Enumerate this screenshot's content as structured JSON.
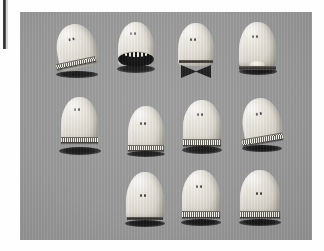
{
  "page": {
    "background_color": "#fefefe",
    "gutter_bar_color": "#2b2b2b"
  },
  "photo": {
    "background_color": "#9a9a9a",
    "body_color": "#e9e6de",
    "shadow_color": "#141414",
    "accent_dark": "#2d2b27",
    "x": 20,
    "y": 12,
    "width": 292,
    "height": 228,
    "subject_count": 11,
    "grid_rows": 3,
    "row_counts": [
      4,
      4,
      3
    ],
    "description": "Eleven rounded capsule-shaped figures with two dot eyes arranged on a gray surface"
  },
  "figures": [
    {
      "id": "figure-1",
      "row": 1,
      "column": 1,
      "pose": "tilted-left",
      "mouth": "toothed-band",
      "x": 54,
      "y": 24,
      "w": 44,
      "h": 54,
      "body": {
        "x": 2,
        "y": 0,
        "w": 40,
        "h": 44,
        "rotate": -12
      },
      "eyes": {
        "x": 16,
        "y": 13
      },
      "band": {
        "x": 2,
        "y": 36,
        "w": 40,
        "h": 4,
        "rotate": -12
      },
      "shadow": {
        "x": 2,
        "y": 47,
        "w": 42,
        "h": 7
      }
    },
    {
      "id": "figure-2",
      "row": 1,
      "column": 2,
      "pose": "upright",
      "mouth": "wide-open-dark",
      "x": 116,
      "y": 22,
      "w": 40,
      "h": 56,
      "body": {
        "x": 2,
        "y": 0,
        "w": 36,
        "h": 44,
        "rotate": 0
      },
      "eyes": {
        "x": 14,
        "y": 10
      },
      "mouth_open": {
        "x": 2,
        "y": 29,
        "w": 36,
        "h": 15
      },
      "shadow": {
        "x": 1,
        "y": 43,
        "w": 38,
        "h": 8
      }
    },
    {
      "id": "figure-3",
      "row": 1,
      "column": 3,
      "pose": "upright",
      "mouth": "closed-rim",
      "x": 176,
      "y": 23,
      "w": 40,
      "h": 58,
      "body": {
        "x": 2,
        "y": 0,
        "w": 36,
        "h": 43,
        "rotate": 0
      },
      "eyes": {
        "x": 14,
        "y": 15
      },
      "rim": {
        "x": 3,
        "y": 37,
        "w": 34,
        "h": 3
      },
      "bowtie": {
        "x": 5,
        "y": 42,
        "w": 30,
        "h": 13
      }
    },
    {
      "id": "figure-4",
      "row": 1,
      "column": 4,
      "pose": "upright",
      "mouth": "rim-with-blob",
      "x": 237,
      "y": 22,
      "w": 42,
      "h": 56,
      "body": {
        "x": 2,
        "y": 0,
        "w": 37,
        "h": 45,
        "rotate": 0
      },
      "eyes": {
        "x": 15,
        "y": 13
      },
      "blob": {
        "x": 12,
        "y": 39,
        "w": 16,
        "h": 7
      },
      "rim": {
        "x": 2,
        "y": 44,
        "w": 37,
        "h": 4
      },
      "shadow": {
        "x": 2,
        "y": 46,
        "w": 38,
        "h": 7
      }
    },
    {
      "id": "figure-5",
      "row": 2,
      "column": 1,
      "pose": "upright",
      "mouth": "toothed-band",
      "x": 59,
      "y": 97,
      "w": 42,
      "h": 60,
      "body": {
        "x": 2,
        "y": 0,
        "w": 37,
        "h": 45,
        "rotate": 0
      },
      "eyes": {
        "x": 15,
        "y": 11
      },
      "band": {
        "x": 2,
        "y": 40,
        "w": 37,
        "h": 4,
        "rotate": 0
      },
      "shadow": {
        "x": 0,
        "y": 50,
        "w": 42,
        "h": 8
      }
    },
    {
      "id": "figure-6",
      "row": 2,
      "column": 2,
      "pose": "upright",
      "mouth": "toothed-band",
      "x": 126,
      "y": 106,
      "w": 40,
      "h": 54,
      "body": {
        "x": 2,
        "y": 0,
        "w": 36,
        "h": 44,
        "rotate": 0
      },
      "eyes": {
        "x": 14,
        "y": 16
      },
      "band": {
        "x": 2,
        "y": 39,
        "w": 36,
        "h": 4,
        "rotate": 0
      },
      "shadow": {
        "x": 1,
        "y": 45,
        "w": 38,
        "h": 6
      }
    },
    {
      "id": "figure-7",
      "row": 2,
      "column": 3,
      "pose": "upright",
      "mouth": "toothed-band",
      "x": 181,
      "y": 100,
      "w": 42,
      "h": 58,
      "body": {
        "x": 2,
        "y": 0,
        "w": 38,
        "h": 44,
        "rotate": 0
      },
      "eyes": {
        "x": 16,
        "y": 13
      },
      "band": {
        "x": 2,
        "y": 39,
        "w": 38,
        "h": 5,
        "rotate": 0
      },
      "shadow": {
        "x": 1,
        "y": 46,
        "w": 40,
        "h": 8
      }
    },
    {
      "id": "figure-8",
      "row": 2,
      "column": 4,
      "pose": "tilted-left",
      "mouth": "toothed-band",
      "x": 240,
      "y": 98,
      "w": 46,
      "h": 58,
      "body": {
        "x": 2,
        "y": 0,
        "w": 39,
        "h": 45,
        "rotate": -10
      },
      "eyes": {
        "x": 17,
        "y": 14
      },
      "band": {
        "x": 2,
        "y": 38,
        "w": 41,
        "h": 5,
        "rotate": -10
      },
      "shadow": {
        "x": 2,
        "y": 47,
        "w": 40,
        "h": 7
      }
    },
    {
      "id": "figure-9",
      "row": 3,
      "column": 2,
      "pose": "upright",
      "mouth": "plain-base",
      "x": 124,
      "y": 172,
      "w": 42,
      "h": 58,
      "body": {
        "x": 2,
        "y": 0,
        "w": 38,
        "h": 48,
        "rotate": 0
      },
      "eyes": {
        "x": 16,
        "y": 22
      },
      "rim": {
        "x": 3,
        "y": 45,
        "w": 36,
        "h": 3
      },
      "shadow": {
        "x": 1,
        "y": 48,
        "w": 40,
        "h": 7
      }
    },
    {
      "id": "figure-10",
      "row": 3,
      "column": 3,
      "pose": "upright",
      "mouth": "toothed-band",
      "x": 180,
      "y": 170,
      "w": 42,
      "h": 60,
      "body": {
        "x": 2,
        "y": 0,
        "w": 38,
        "h": 46,
        "rotate": 0
      },
      "eyes": {
        "x": 16,
        "y": 15
      },
      "band": {
        "x": 2,
        "y": 41,
        "w": 38,
        "h": 5,
        "rotate": 0
      },
      "shadow": {
        "x": 1,
        "y": 49,
        "w": 40,
        "h": 7
      }
    },
    {
      "id": "figure-11",
      "row": 3,
      "column": 4,
      "pose": "upright",
      "mouth": "toothed-band",
      "x": 238,
      "y": 170,
      "w": 44,
      "h": 60,
      "body": {
        "x": 2,
        "y": 0,
        "w": 40,
        "h": 46,
        "rotate": 0
      },
      "eyes": {
        "x": 18,
        "y": 22
      },
      "band": {
        "x": 2,
        "y": 41,
        "w": 40,
        "h": 5,
        "rotate": 0
      },
      "shadow": {
        "x": 1,
        "y": 49,
        "w": 42,
        "h": 7
      }
    }
  ]
}
